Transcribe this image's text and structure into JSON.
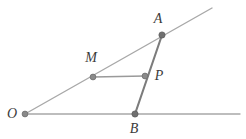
{
  "figure": {
    "type": "geometry-diagram",
    "background_color": "#ffffff",
    "width": 246,
    "height": 139,
    "ray_color": "#a8a8a8",
    "segment_color": "#7c7c7c",
    "connector_color": "#9a9a9a",
    "vertex_fill": "#8a8a8a",
    "vertex_stroke": "#6e6e6e",
    "label_color": "#3b3b3b"
  },
  "labels": {
    "A": "A",
    "B": "B",
    "M": "M",
    "P": "P",
    "O": "O"
  },
  "chart_data": {
    "type": "scatter",
    "title": "",
    "xlabel": "",
    "ylabel": "",
    "grid": false,
    "legend": null,
    "xlim": [
      0,
      246
    ],
    "ylim": [
      139,
      0
    ],
    "points": [
      {
        "name": "O",
        "x": 25,
        "y": 114,
        "label": "O",
        "label_x": 12,
        "label_y": 114
      },
      {
        "name": "A",
        "x": 162,
        "y": 35,
        "label": "A",
        "label_x": 158,
        "label_y": 19
      },
      {
        "name": "B",
        "x": 135,
        "y": 114,
        "label": "B",
        "label_x": 134,
        "label_y": 129
      },
      {
        "name": "M",
        "x": 93,
        "y": 77,
        "label": "M",
        "label_x": 91,
        "label_y": 58
      },
      {
        "name": "P",
        "x": 145,
        "y": 76,
        "label": "P",
        "label_x": 159,
        "label_y": 76
      }
    ],
    "lines": [
      {
        "name": "ray-OA",
        "from": [
          25,
          114
        ],
        "to": [
          212,
          8
        ],
        "style": "ray",
        "color": "#a8a8a8",
        "width": 1.4
      },
      {
        "name": "ray-OB",
        "from": [
          25,
          114
        ],
        "to": [
          240,
          114
        ],
        "style": "ray",
        "color": "#a8a8a8",
        "width": 1.4
      },
      {
        "name": "segment-AB",
        "from": [
          162,
          35
        ],
        "to": [
          135,
          114
        ],
        "style": "segment",
        "color": "#7c7c7c",
        "width": 2.1
      },
      {
        "name": "segment-MP",
        "from": [
          93,
          77
        ],
        "to": [
          145,
          76
        ],
        "style": "segment",
        "color": "#9a9a9a",
        "width": 1.4
      }
    ]
  }
}
